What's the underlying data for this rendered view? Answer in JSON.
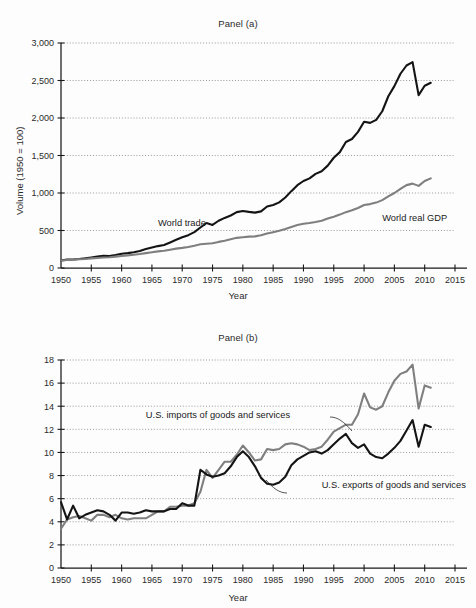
{
  "figure": {
    "background": "#fdfdfd",
    "panels": [
      "Panel (a)",
      "Panel (b)"
    ]
  },
  "chart_data": [
    {
      "type": "line",
      "title": "Panel (a)",
      "xlabel": "Year",
      "ylabel": "Volume (1950 = 100)",
      "xlim": [
        1950,
        2015
      ],
      "ylim": [
        0,
        3000
      ],
      "xticks": [
        1950,
        1955,
        1960,
        1965,
        1970,
        1975,
        1980,
        1985,
        1990,
        1995,
        2000,
        2005,
        2010,
        2015
      ],
      "yticks": [
        0,
        500,
        1000,
        1500,
        2000,
        2500,
        3000
      ],
      "ytick_labels": [
        "0",
        "500",
        "1,000",
        "1,500",
        "2,000",
        "2,500",
        "3,000"
      ],
      "grid": true,
      "legend_position": "inline-annotations",
      "series": [
        {
          "name": "World trade",
          "color": "#141414",
          "label_x": 1966,
          "label_y": 560,
          "x": [
            1950,
            1951,
            1952,
            1953,
            1954,
            1955,
            1956,
            1957,
            1958,
            1959,
            1960,
            1961,
            1962,
            1963,
            1964,
            1965,
            1966,
            1967,
            1968,
            1969,
            1970,
            1971,
            1972,
            1973,
            1974,
            1975,
            1976,
            1977,
            1978,
            1979,
            1980,
            1981,
            1982,
            1983,
            1984,
            1985,
            1986,
            1987,
            1988,
            1989,
            1990,
            1991,
            1992,
            1993,
            1994,
            1995,
            1996,
            1997,
            1998,
            1999,
            2000,
            2001,
            2002,
            2003,
            2004,
            2005,
            2006,
            2007,
            2008,
            2009,
            2010,
            2011
          ],
          "y": [
            100,
            112,
            114,
            120,
            128,
            140,
            152,
            162,
            158,
            172,
            190,
            198,
            210,
            226,
            252,
            272,
            292,
            306,
            340,
            376,
            410,
            438,
            478,
            540,
            600,
            575,
            630,
            668,
            700,
            745,
            760,
            748,
            738,
            755,
            820,
            840,
            875,
            940,
            1025,
            1105,
            1160,
            1195,
            1255,
            1290,
            1365,
            1470,
            1545,
            1680,
            1720,
            1815,
            1950,
            1935,
            1975,
            2090,
            2290,
            2425,
            2590,
            2700,
            2745,
            2305,
            2430,
            2470
          ]
        },
        {
          "name": "World real GDP",
          "color": "#7f7f7f",
          "label_x": 2003,
          "label_y": 630,
          "x": [
            1950,
            1951,
            1952,
            1953,
            1954,
            1955,
            1956,
            1957,
            1958,
            1959,
            1960,
            1961,
            1962,
            1963,
            1964,
            1965,
            1966,
            1967,
            1968,
            1969,
            1970,
            1971,
            1972,
            1973,
            1974,
            1975,
            1976,
            1977,
            1978,
            1979,
            1980,
            1981,
            1982,
            1983,
            1984,
            1985,
            1986,
            1987,
            1988,
            1989,
            1990,
            1991,
            1992,
            1993,
            1994,
            1995,
            1996,
            1997,
            1998,
            1999,
            2000,
            2001,
            2002,
            2003,
            2004,
            2005,
            2006,
            2007,
            2008,
            2009,
            2010,
            2011
          ],
          "y": [
            100,
            106,
            110,
            116,
            120,
            128,
            134,
            140,
            144,
            152,
            160,
            168,
            176,
            186,
            198,
            210,
            222,
            230,
            244,
            258,
            268,
            280,
            296,
            316,
            324,
            330,
            348,
            364,
            384,
            402,
            410,
            418,
            422,
            436,
            460,
            478,
            496,
            520,
            548,
            572,
            590,
            600,
            614,
            630,
            660,
            685,
            712,
            745,
            770,
            800,
            840,
            852,
            872,
            905,
            955,
            1000,
            1055,
            1105,
            1125,
            1095,
            1160,
            1195
          ]
        }
      ]
    },
    {
      "type": "line",
      "title": "Panel (b)",
      "xlabel": "Year",
      "ylabel": "Percent of GDP",
      "xlim": [
        1950,
        2015
      ],
      "ylim": [
        0,
        18
      ],
      "xticks": [
        1950,
        1955,
        1960,
        1965,
        1970,
        1975,
        1980,
        1985,
        1990,
        1995,
        2000,
        2005,
        2010,
        2015
      ],
      "yticks": [
        0,
        2,
        4,
        6,
        8,
        10,
        12,
        14,
        16,
        18
      ],
      "ytick_labels": [
        "0",
        "2",
        "4",
        "6",
        "8",
        "10",
        "12",
        "14",
        "16",
        "18"
      ],
      "grid": true,
      "legend_position": "inline-annotations",
      "series": [
        {
          "name": "U.S. imports of goods and services",
          "color": "#7f7f7f",
          "label_x": 1964,
          "label_y": 13.0,
          "x": [
            1950,
            1951,
            1952,
            1953,
            1954,
            1955,
            1956,
            1957,
            1958,
            1959,
            1960,
            1961,
            1962,
            1963,
            1964,
            1965,
            1966,
            1967,
            1968,
            1969,
            1970,
            1971,
            1972,
            1973,
            1974,
            1975,
            1976,
            1977,
            1978,
            1979,
            1980,
            1981,
            1982,
            1983,
            1984,
            1985,
            1986,
            1987,
            1988,
            1989,
            1990,
            1991,
            1992,
            1993,
            1994,
            1995,
            1996,
            1997,
            1998,
            1999,
            2000,
            2001,
            2002,
            2003,
            2004,
            2005,
            2006,
            2007,
            2008,
            2009,
            2010,
            2011
          ],
          "y": [
            3.4,
            4.2,
            4.4,
            4.5,
            4.3,
            4.1,
            4.6,
            4.6,
            4.4,
            4.6,
            4.3,
            4.2,
            4.3,
            4.3,
            4.3,
            4.6,
            4.9,
            4.9,
            5.3,
            5.3,
            5.4,
            5.4,
            5.6,
            6.6,
            8.5,
            7.8,
            8.5,
            9.2,
            9.2,
            9.8,
            10.6,
            10.0,
            9.3,
            9.4,
            10.3,
            10.2,
            10.3,
            10.7,
            10.8,
            10.7,
            10.5,
            10.2,
            10.3,
            10.5,
            11.1,
            11.8,
            12.1,
            12.4,
            12.4,
            13.3,
            15.1,
            13.9,
            13.7,
            14.0,
            15.2,
            16.2,
            16.8,
            17.0,
            17.6,
            13.8,
            15.8,
            15.6
          ]
        },
        {
          "name": "U.S. exports of goods and services",
          "color": "#141414",
          "label_x": 1993,
          "label_y": 6.9,
          "x": [
            1950,
            1951,
            1952,
            1953,
            1954,
            1955,
            1956,
            1957,
            1958,
            1959,
            1960,
            1961,
            1962,
            1963,
            1964,
            1965,
            1966,
            1967,
            1968,
            1969,
            1970,
            1971,
            1972,
            1973,
            1974,
            1975,
            1976,
            1977,
            1978,
            1979,
            1980,
            1981,
            1982,
            1983,
            1984,
            1985,
            1986,
            1987,
            1988,
            1989,
            1990,
            1991,
            1992,
            1993,
            1994,
            1995,
            1996,
            1997,
            1998,
            1999,
            2000,
            2001,
            2002,
            2003,
            2004,
            2005,
            2006,
            2007,
            2008,
            2009,
            2010,
            2011
          ],
          "y": [
            5.7,
            4.2,
            5.4,
            4.3,
            4.6,
            4.8,
            5.0,
            4.9,
            4.6,
            4.1,
            4.8,
            4.8,
            4.7,
            4.8,
            5.0,
            4.9,
            4.9,
            4.9,
            5.1,
            5.1,
            5.6,
            5.4,
            5.4,
            8.5,
            8.1,
            7.9,
            8.0,
            8.2,
            8.8,
            9.6,
            10.1,
            9.6,
            8.8,
            7.8,
            7.3,
            7.2,
            7.4,
            7.9,
            8.9,
            9.4,
            9.7,
            10.0,
            10.1,
            9.9,
            10.2,
            10.7,
            11.2,
            11.6,
            10.8,
            10.4,
            10.7,
            9.9,
            9.6,
            9.5,
            9.9,
            10.4,
            11.0,
            11.9,
            12.8,
            10.5,
            12.4,
            12.2
          ]
        }
      ]
    }
  ]
}
